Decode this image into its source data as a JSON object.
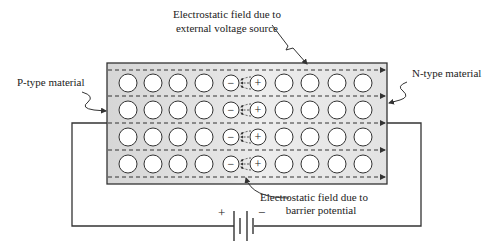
{
  "labels": {
    "ext_field_line1": "Electrostatic field  due to",
    "ext_field_line2": "external voltage source",
    "p_type": "P-type material",
    "n_type": "N-type material",
    "barrier_line1": "Electrostatic field  due to",
    "barrier_line2": "barrier potential",
    "battery_plus": "+",
    "battery_minus": "−",
    "ion_minus": "−",
    "ion_plus": "+"
  },
  "colors": {
    "box_fill": "#d9d9d9",
    "box_fill_center": "#f2f2f2",
    "stroke": "#333333",
    "circle_fill": "#ffffff"
  },
  "structure": {
    "rows": 4,
    "p_side_carriers_per_row": 4,
    "n_side_carriers_per_row": 4,
    "negative_ions_per_row": 1,
    "positive_ions_per_row": 1
  }
}
